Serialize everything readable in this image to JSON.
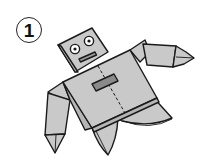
{
  "diagram": {
    "step_number": "1",
    "colors": {
      "paper_fill": "#c9c9c9",
      "outline": "#1a1a1a",
      "button_fill": "#8a8a8a",
      "background": "#ffffff"
    },
    "parts": [
      {
        "name": "head",
        "features": [
          "left-eye",
          "right-eye",
          "mouth"
        ]
      },
      {
        "name": "body",
        "features": [
          "center-fold-dashed-line",
          "chest-button"
        ]
      },
      {
        "name": "right-arm"
      },
      {
        "name": "left-arm"
      },
      {
        "name": "legs"
      }
    ]
  }
}
